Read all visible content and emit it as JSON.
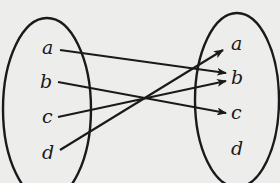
{
  "diagram": {
    "type": "mapping",
    "domain_set": {
      "name": "domain",
      "elements": [
        {
          "label": "a",
          "x": 48,
          "y": 48
        },
        {
          "label": "b",
          "x": 46,
          "y": 82
        },
        {
          "label": "c",
          "x": 47,
          "y": 117
        },
        {
          "label": "d",
          "x": 48,
          "y": 153
        }
      ],
      "ellipse": {
        "cx": 47,
        "cy": 109,
        "rx": 44,
        "ry": 91
      }
    },
    "codomain_set": {
      "name": "codomain",
      "elements": [
        {
          "label": "a",
          "x": 236,
          "y": 44
        },
        {
          "label": "b",
          "x": 236,
          "y": 78
        },
        {
          "label": "c",
          "x": 236,
          "y": 113
        },
        {
          "label": "d",
          "x": 236,
          "y": 149
        }
      ],
      "ellipse": {
        "cx": 237,
        "cy": 100,
        "rx": 42,
        "ry": 87
      }
    },
    "mappings": [
      {
        "from": "a",
        "to": "b"
      },
      {
        "from": "b",
        "to": "c"
      },
      {
        "from": "c",
        "to": "b"
      },
      {
        "from": "d",
        "to": "a"
      }
    ],
    "colors": {
      "ink": "#1a1a1a",
      "paper": "#ededeb"
    }
  }
}
